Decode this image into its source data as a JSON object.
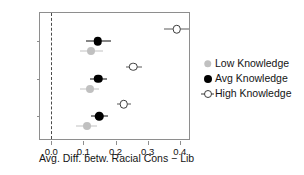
{
  "chart_data": {
    "type": "scatter",
    "title": "",
    "xlabel": "Avg. Diff. betw. Racial Cons − Lib",
    "ylabel": "",
    "xlim": [
      -0.035,
      0.435
    ],
    "xticks": [
      0.0,
      0.1,
      0.2,
      0.3,
      0.4
    ],
    "xticklabels": [
      "0.0",
      "0.1",
      "0.2",
      "0.3",
      "0.4"
    ],
    "categories": [
      "1980",
      "1976",
      "1972"
    ],
    "grid": false,
    "legend_position": "right",
    "reference_line": {
      "x": 0.0,
      "style": "dashed",
      "color": "#4a4a4a"
    },
    "series": [
      {
        "name": "Low Knowledge",
        "marker": "filled-circle",
        "color": "#c0c0c0",
        "values": [
          0.125,
          0.12,
          0.11
        ],
        "ci_low": [
          0.088,
          0.09,
          0.078
        ],
        "ci_high": [
          0.16,
          0.15,
          0.142
        ]
      },
      {
        "name": "Avg Knowledge",
        "marker": "filled-circle",
        "color": "#000000",
        "values": [
          0.145,
          0.147,
          0.15
        ],
        "ci_low": [
          0.108,
          0.122,
          0.124
        ],
        "ci_high": [
          0.185,
          0.172,
          0.178
        ]
      },
      {
        "name": "High Knowledge",
        "marker": "open-circle",
        "color": "#3d3d3d",
        "values": [
          0.39,
          0.256,
          0.225
        ],
        "ci_low": [
          0.352,
          0.232,
          0.204
        ],
        "ci_high": [
          0.428,
          0.282,
          0.248
        ]
      }
    ]
  },
  "legend": {
    "items": [
      {
        "label": "Low Knowledge",
        "key": "low-knowledge-marker"
      },
      {
        "label": "Avg Knowledge",
        "key": "avg-knowledge-marker"
      },
      {
        "label": "High Knowledge",
        "key": "high-knowledge-marker"
      }
    ]
  }
}
